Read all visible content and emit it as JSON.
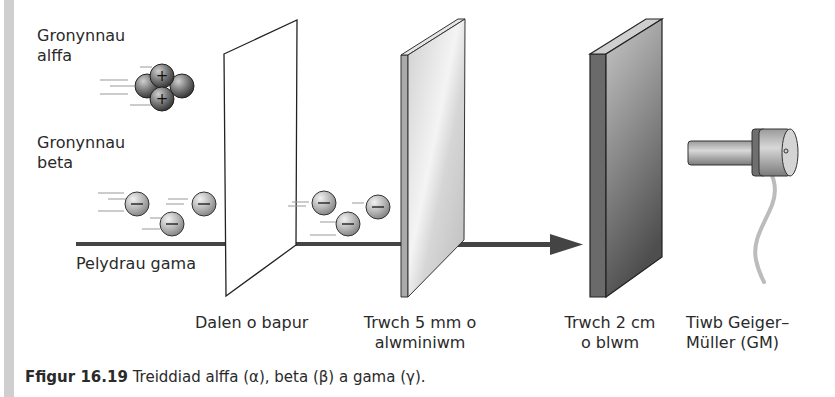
{
  "labels": {
    "alpha": [
      "Gronynnau",
      "alffa"
    ],
    "beta": [
      "Gronynnau",
      "beta"
    ],
    "gamma": "Pelydrau gama",
    "paper": "Dalen o bapur",
    "aluminium": [
      "Trwch 5 mm o",
      "alwminiwm"
    ],
    "lead": [
      "Trwch 2 cm",
      "o blwm"
    ],
    "gm_tube": [
      "Tiwb Geiger–",
      "Müller (GM)"
    ]
  },
  "caption": {
    "figure_number": "Ffigur 16.19",
    "text": " Treiddiad alffa (α), beta (β) a gama (γ)."
  },
  "particles": {
    "alpha_sign": "+",
    "beta_sign": "−"
  },
  "colors": {
    "gamma_beam": "#444444",
    "paper": "#ffffff",
    "aluminium": "#d8d8d8",
    "lead": "#6a6a6a",
    "left_strip": "#cfcfcf"
  }
}
